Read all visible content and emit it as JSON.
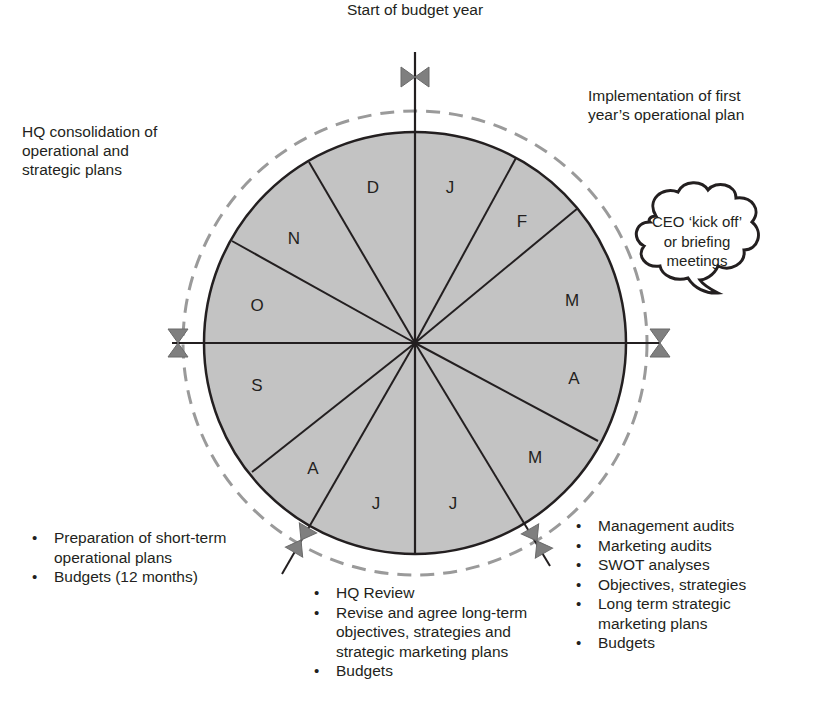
{
  "diagram": {
    "title_top": "Start of budget year",
    "center": {
      "x": 415,
      "y": 343
    },
    "radius": 211,
    "dashed_radius": 232,
    "colors": {
      "fill": "#c3c3c3",
      "stroke": "#231f20",
      "dashed": "#9a9a9a",
      "valve": "#7f7f7f",
      "text": "#231f20"
    },
    "segments": [
      {
        "label": "J",
        "month": "January"
      },
      {
        "label": "F",
        "month": "February"
      },
      {
        "label": "M",
        "month": "March"
      },
      {
        "label": "A",
        "month": "April"
      },
      {
        "label": "M",
        "month": "May"
      },
      {
        "label": "J",
        "month": "June"
      },
      {
        "label": "J",
        "month": "July"
      },
      {
        "label": "A",
        "month": "August"
      },
      {
        "label": "S",
        "month": "September"
      },
      {
        "label": "O",
        "month": "October"
      },
      {
        "label": "N",
        "month": "November"
      },
      {
        "label": "D",
        "month": "December"
      }
    ],
    "annotations": {
      "top_right": [
        "Implementation of first",
        "year’s operational plan"
      ],
      "top_left": [
        "HQ consolidation of",
        "operational and",
        "strategic plans"
      ],
      "cloud": [
        "CEO ‘kick off’",
        "or briefing",
        "meetings"
      ],
      "bottom_left": [
        "Preparation of short-term operational plans",
        "Budgets (12 months)"
      ],
      "bottom_center": [
        "HQ Review",
        "Revise and agree long-term objectives, strategies and strategic marketing plans",
        "Budgets"
      ],
      "bottom_right": [
        "Management audits",
        "Marketing audits",
        "SWOT analyses",
        "Objectives, strategies",
        "Long term strategic marketing plans",
        "Budgets"
      ]
    }
  }
}
